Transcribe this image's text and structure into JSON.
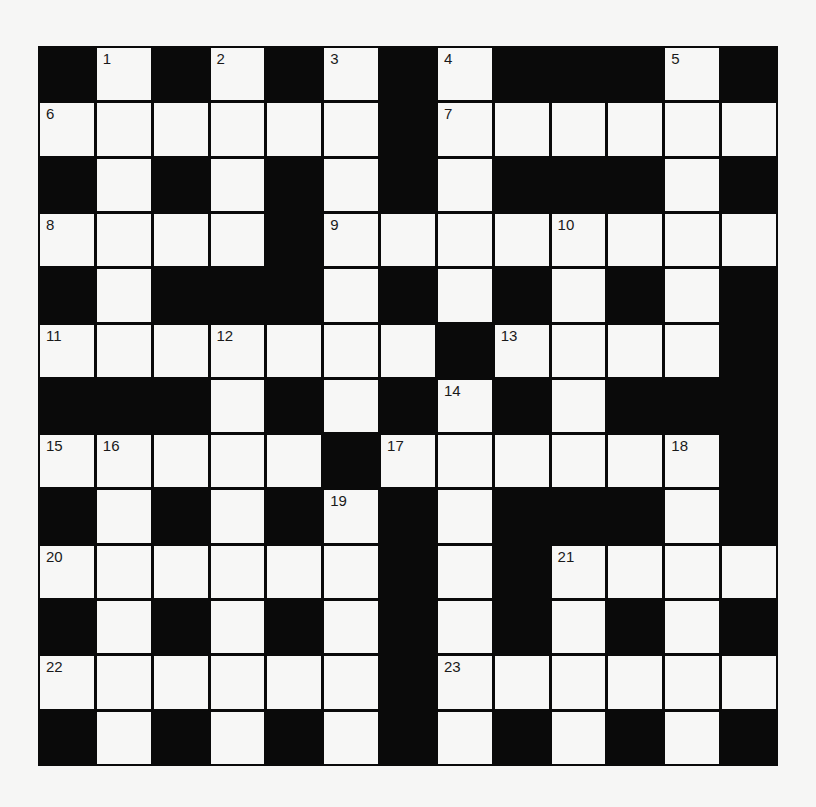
{
  "puzzle": {
    "rows": 13,
    "cols": 13,
    "layout": [
      "#.#.#.#.###.#",
      "......#......",
      "#.#.#.#.###.#",
      "....#........",
      "#.###.#.#.#.#",
      ".......#....#",
      "###.#.#.#.###",
      ".....#......#",
      "#.#.#.#.###.#",
      "......#.#....",
      "#.#.#.#.#.#.#",
      "......#......",
      "#.#.#.#.#.#.#"
    ],
    "numbers": [
      {
        "row": 0,
        "col": 1,
        "n": "1"
      },
      {
        "row": 0,
        "col": 3,
        "n": "2"
      },
      {
        "row": 0,
        "col": 5,
        "n": "3"
      },
      {
        "row": 0,
        "col": 7,
        "n": "4"
      },
      {
        "row": 0,
        "col": 11,
        "n": "5"
      },
      {
        "row": 1,
        "col": 0,
        "n": "6"
      },
      {
        "row": 1,
        "col": 7,
        "n": "7"
      },
      {
        "row": 3,
        "col": 0,
        "n": "8"
      },
      {
        "row": 3,
        "col": 5,
        "n": "9"
      },
      {
        "row": 3,
        "col": 9,
        "n": "10"
      },
      {
        "row": 5,
        "col": 0,
        "n": "11"
      },
      {
        "row": 5,
        "col": 3,
        "n": "12"
      },
      {
        "row": 5,
        "col": 8,
        "n": "13"
      },
      {
        "row": 6,
        "col": 7,
        "n": "14"
      },
      {
        "row": 7,
        "col": 0,
        "n": "15"
      },
      {
        "row": 7,
        "col": 1,
        "n": "16"
      },
      {
        "row": 7,
        "col": 6,
        "n": "17"
      },
      {
        "row": 7,
        "col": 11,
        "n": "18"
      },
      {
        "row": 8,
        "col": 5,
        "n": "19"
      },
      {
        "row": 9,
        "col": 0,
        "n": "20"
      },
      {
        "row": 9,
        "col": 9,
        "n": "21"
      },
      {
        "row": 11,
        "col": 0,
        "n": "22"
      },
      {
        "row": 11,
        "col": 7,
        "n": "23"
      }
    ],
    "colors": {
      "block": "#0a0a0a",
      "cell": "#f7f7f6",
      "number": "#1a1a1a"
    }
  }
}
